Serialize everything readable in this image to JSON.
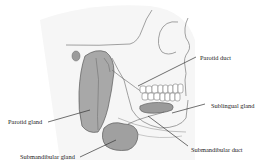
{
  "figure": {
    "background": "#ffffff",
    "ink_color": "#555555",
    "gland_fill": "#a8a8a8"
  },
  "labels": {
    "parotid_duct": "Parotid duct",
    "sublingual_gland": "Sublingual gland",
    "parotid_gland": "Parotid gland",
    "submandibular_duct": "Submandibular duct",
    "submandibular_gland": "Submandibular gland"
  }
}
